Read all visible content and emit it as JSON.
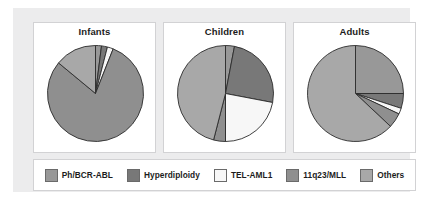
{
  "figure": {
    "background": "#ffffff",
    "panel_color": "#ececed",
    "card_background": "#ffffff",
    "card_border": "#d2d2d4"
  },
  "legend": {
    "items": [
      {
        "label": "Ph/BCR-ABL",
        "color": "#989898",
        "edge": "#6a6a6a"
      },
      {
        "label": "Hyperdiploidy",
        "color": "#787878",
        "edge": "#6a6a6a"
      },
      {
        "label": "TEL-AML1",
        "color": "#f7f7f7",
        "edge": "#6a6a6a"
      },
      {
        "label": "11q23/MLL",
        "color": "#8f8f8f",
        "edge": "#6a6a6a"
      },
      {
        "label": "Others",
        "color": "#a8a8a8",
        "edge": "#6a6a6a"
      }
    ]
  },
  "chart_data": [
    {
      "type": "pie",
      "title": "Infants",
      "categories": [
        "Ph/BCR-ABL",
        "Hyperdiploidy",
        "TEL-AML1",
        "11q23/MLL",
        "Others"
      ],
      "values": [
        2,
        2,
        2,
        80,
        14
      ],
      "colors": [
        "#989898",
        "#787878",
        "#f7f7f7",
        "#8f8f8f",
        "#a8a8a8"
      ],
      "start_angle": 90,
      "direction": "clockwise",
      "legend_position": "bottom",
      "grid": false
    },
    {
      "type": "pie",
      "title": "Children",
      "categories": [
        "Ph/BCR-ABL",
        "Hyperdiploidy",
        "TEL-AML1",
        "11q23/MLL",
        "Others"
      ],
      "values": [
        3,
        25,
        22,
        4,
        46
      ],
      "colors": [
        "#989898",
        "#787878",
        "#f7f7f7",
        "#8f8f8f",
        "#a8a8a8"
      ],
      "start_angle": 90,
      "direction": "clockwise",
      "legend_position": "bottom",
      "grid": false
    },
    {
      "type": "pie",
      "title": "Adults",
      "categories": [
        "Ph/BCR-ABL",
        "Hyperdiploidy",
        "TEL-AML1",
        "11q23/MLL",
        "Others"
      ],
      "values": [
        25,
        5,
        2,
        5,
        63
      ],
      "colors": [
        "#989898",
        "#787878",
        "#f7f7f7",
        "#8f8f8f",
        "#a8a8a8"
      ],
      "start_angle": 90,
      "direction": "clockwise",
      "legend_position": "bottom",
      "grid": false
    }
  ]
}
